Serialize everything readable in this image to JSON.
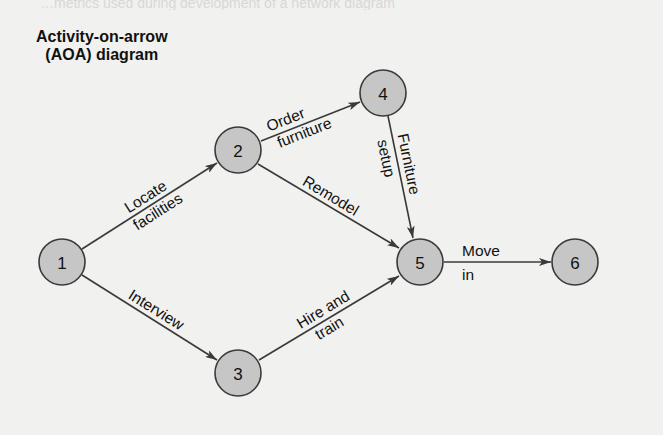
{
  "bleed_text": "…metrics used during development of a network diagram",
  "title": {
    "line1": "Activity-on-arrow",
    "line2": "(AOA) diagram"
  },
  "colors": {
    "background": "#f1f1ef",
    "node_fill": "#c6c6c6",
    "node_stroke": "#3a3a3a",
    "text": "#111111"
  },
  "nodes": [
    {
      "id": "1",
      "label": "1"
    },
    {
      "id": "2",
      "label": "2"
    },
    {
      "id": "3",
      "label": "3"
    },
    {
      "id": "4",
      "label": "4"
    },
    {
      "id": "5",
      "label": "5"
    },
    {
      "id": "6",
      "label": "6"
    }
  ],
  "edges": [
    {
      "from": "1",
      "to": "2",
      "label_top": "Locate",
      "label_bottom": "facilities"
    },
    {
      "from": "1",
      "to": "3",
      "label_top": "Interview",
      "label_bottom": ""
    },
    {
      "from": "2",
      "to": "4",
      "label_top": "Order",
      "label_bottom": "furniture"
    },
    {
      "from": "2",
      "to": "5",
      "label_top": "Remodel",
      "label_bottom": ""
    },
    {
      "from": "4",
      "to": "5",
      "label_top": "Furniture",
      "label_bottom": "setup"
    },
    {
      "from": "3",
      "to": "5",
      "label_top": "Hire and",
      "label_bottom": "train"
    },
    {
      "from": "5",
      "to": "6",
      "label_top": "Move",
      "label_bottom": "in"
    }
  ]
}
